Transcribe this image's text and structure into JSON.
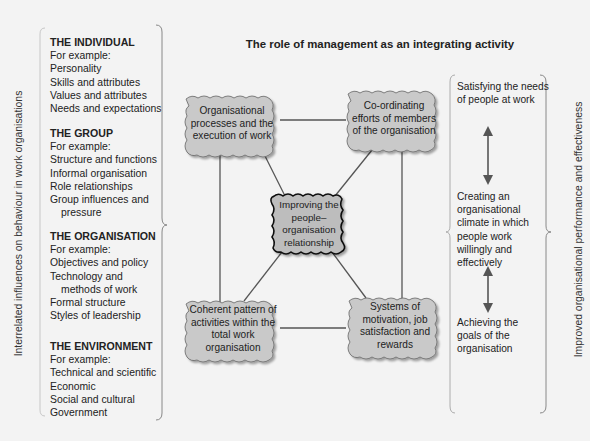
{
  "title": "The role of management as an integrating activity",
  "left_axis_label": "Interrelated influences on behaviour in work organisations",
  "right_axis_label": "Improved organisational performance and effectiveness",
  "influences": [
    {
      "heading": "THE INDIVIDUAL",
      "intro": "For example:",
      "items": [
        "Personality",
        "Skills and attributes",
        "Values and attributes",
        "Needs and expectations"
      ]
    },
    {
      "heading": "THE GROUP",
      "intro": "For example:",
      "items": [
        "Structure and functions",
        "Informal organisation",
        "Role relationships",
        "Group influences and",
        "pressure"
      ]
    },
    {
      "heading": "THE ORGANISATION",
      "intro": "For example:",
      "items": [
        "Objectives and policy",
        "Technology and",
        "methods of work",
        "Formal structure",
        "Styles of leadership"
      ]
    },
    {
      "heading": "THE ENVIRONMENT",
      "intro": "For example:",
      "items": [
        "Technical and scientific",
        "Economic",
        "Social and cultural",
        "Government"
      ]
    }
  ],
  "boxes": {
    "top_left": "Organisational processes and the execution of work",
    "top_right": "Co-ordinating efforts of members of the organisation",
    "center": "Improving the people–organisation relationship",
    "bottom_left": "Coherent pattern of activities within the total work organisation",
    "bottom_right": "Systems of motivation, job satisfaction and rewards"
  },
  "outcomes": [
    "Satisfying the needs of people at work",
    "Creating an organisational climate in which people work willingly and effectively",
    "Achieving the goals of the organisation"
  ],
  "colors": {
    "box_fill": "#c9c9c9",
    "center_fill": "#bdbdbd",
    "line": "#555555",
    "background": "#f3f3f3"
  }
}
